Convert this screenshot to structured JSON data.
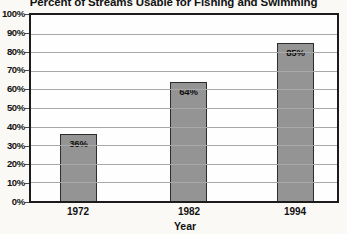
{
  "chart_data": {
    "type": "bar",
    "title": "Percent of Streams Usable for Fishing and Swimming",
    "categories": [
      "1972",
      "1982",
      "1994"
    ],
    "values": [
      36,
      64,
      85
    ],
    "value_labels": [
      "36%",
      "64%",
      "85%"
    ],
    "xlabel": "Year",
    "ylabel": "",
    "ylim": [
      0,
      100
    ],
    "y_tick_step": 10,
    "y_ticks": [
      "100%",
      "90%",
      "80%",
      "70%",
      "60%",
      "50%",
      "40%",
      "30%",
      "20%",
      "10%",
      "0%"
    ],
    "grid": "horizontal",
    "legend": "none",
    "colors": {
      "bar_fill": "#949494",
      "bar_border": "#2d2d2d",
      "plot_border": "#1c1c1c",
      "gridline": "#a8a8a8",
      "plot_background": "#fefefe",
      "page_background": "#faf9f6",
      "text": "#111111"
    }
  }
}
